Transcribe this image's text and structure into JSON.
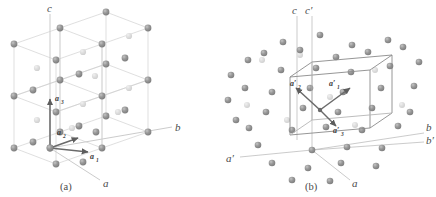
{
  "figure": {
    "background_color": "#ffffff",
    "panels": [
      {
        "id": "a",
        "caption": "(a)",
        "description": "Body-centred tetragonal lattice drawn as a 2x2x2 array of conventional cells with the conventional axes a, b, c and the three basis vectors a1, a2, a3 at the origin",
        "axes": [
          {
            "name": "c-axis-label",
            "label": "c"
          },
          {
            "name": "b-axis-label",
            "label": "b"
          },
          {
            "name": "a-axis-label",
            "label": "a"
          }
        ],
        "vectors": [
          {
            "name": "a1",
            "base": "a",
            "subscript": "1"
          },
          {
            "name": "a2",
            "base": "a",
            "subscript": "2"
          },
          {
            "name": "a3",
            "base": "a",
            "subscript": "3"
          }
        ]
      },
      {
        "id": "b",
        "caption": "(b)",
        "description": "Same lattice with the primitive cell outlined and the primitive basis vectors a1', a2', a3' shown, together with both conventional and primitive axes",
        "axes": [
          {
            "name": "c-axis-label",
            "label": "c"
          },
          {
            "name": "c-prime-axis-label",
            "label": "c′"
          },
          {
            "name": "b-axis-label",
            "label": "b"
          },
          {
            "name": "b-prime-axis-label",
            "label": "b′"
          },
          {
            "name": "a-axis-label",
            "label": "a"
          },
          {
            "name": "a-prime-axis-label",
            "label": "a′"
          }
        ],
        "vectors": [
          {
            "name": "a1-prime",
            "base": "a′",
            "subscript": "1"
          },
          {
            "name": "a2-prime",
            "base": "a′",
            "subscript": "2"
          },
          {
            "name": "a3-prime",
            "base": "a′",
            "subscript": "3"
          }
        ]
      }
    ],
    "colors": {
      "atom_front": "#8e8e8e",
      "atom_back": "#d8d8d8",
      "lattice_line": "#c9c9c9",
      "cell_outline": "#8a8a8a",
      "axis_line": "#b0b0b0",
      "vector": "#6a6a6a",
      "text": "#4a4a4a"
    }
  },
  "labels": {
    "panel_a_c": "c",
    "panel_a_b": "b",
    "panel_a_a": "a",
    "panel_a_caption": "(a)",
    "panel_a_v1_base": "a",
    "panel_a_v1_sub": "1",
    "panel_a_v2_base": "a",
    "panel_a_v2_sub": "2",
    "panel_a_v3_base": "a",
    "panel_a_v3_sub": "3",
    "panel_b_c": "c",
    "panel_b_cp": "c′",
    "panel_b_b": "b",
    "panel_b_bp": "b′",
    "panel_b_a": "a",
    "panel_b_ap": "a′",
    "panel_b_caption": "(b)",
    "panel_b_v1_base": "a′",
    "panel_b_v1_sub": "1",
    "panel_b_v2_base": "a′",
    "panel_b_v2_sub": "2",
    "panel_b_v3_base": "a′",
    "panel_b_v3_sub": "3"
  }
}
